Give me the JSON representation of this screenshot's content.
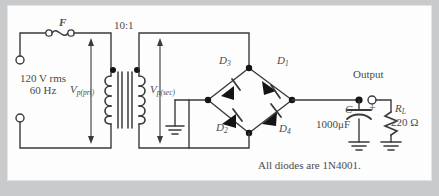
{
  "figure": {
    "caption": "All diodes are 1N4001.",
    "background_color": "#c9cacc",
    "panel_color": "#fdfdfd",
    "line_color": "#3a3a3a"
  },
  "source": {
    "voltage": "120 V rms",
    "frequency": "60 Hz"
  },
  "fuse": {
    "label": "F"
  },
  "transformer": {
    "turns_ratio": "10:1",
    "primary_voltage_label": "V",
    "primary_voltage_sub": "p(pri)",
    "secondary_voltage_label": "V",
    "secondary_voltage_sub": "p(sec)"
  },
  "bridge": {
    "diodes": [
      {
        "name": "D",
        "sub": "1"
      },
      {
        "name": "D",
        "sub": "2"
      },
      {
        "name": "D",
        "sub": "3"
      },
      {
        "name": "D",
        "sub": "4"
      }
    ]
  },
  "output": {
    "label": "Output"
  },
  "capacitor": {
    "label": "C",
    "value": "1000μF",
    "polarity": "+"
  },
  "load": {
    "label": "R",
    "sub": "L",
    "value": "220 Ω"
  }
}
